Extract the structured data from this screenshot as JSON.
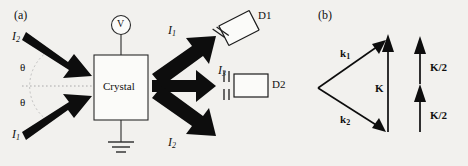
{
  "figure": {
    "background_color": "#f2f1ee",
    "ink_color": "#101010"
  },
  "panel_a": {
    "tag": "(a)",
    "device": {
      "label": "Crystal",
      "voltmeter_label": "V",
      "voltmeter_name": "voltmeter",
      "ground_name": "ground-symbol"
    },
    "input_beams": [
      {
        "name": "input-beam-I2",
        "label": "I",
        "sub": "2",
        "direction": "down-right"
      },
      {
        "name": "input-beam-I1",
        "label": "I",
        "sub": "1",
        "direction": "up-right"
      }
    ],
    "angles": [
      {
        "name": "angle-theta-upper",
        "label": "θ"
      },
      {
        "name": "angle-theta-lower",
        "label": "θ"
      }
    ],
    "output_beams": [
      {
        "name": "output-beam-I1",
        "label": "I",
        "sub": "1",
        "direction": "up-right"
      },
      {
        "name": "output-beam-I3",
        "label": "I",
        "sub": "3",
        "direction": "right"
      },
      {
        "name": "output-beam-I2",
        "label": "I",
        "sub": "2",
        "direction": "down-right"
      }
    ],
    "detectors": [
      {
        "name": "detector-d1",
        "label": "D1",
        "tilted": true
      },
      {
        "name": "detector-d2",
        "label": "D2",
        "tilted": false
      }
    ]
  },
  "panel_b": {
    "tag": "(b)",
    "vectors": [
      {
        "name": "vector-k1",
        "label": "k",
        "sub": "1"
      },
      {
        "name": "vector-k2",
        "label": "k",
        "sub": "2"
      },
      {
        "name": "vector-K",
        "label": "K",
        "sub": ""
      },
      {
        "name": "vector-K-half-upper",
        "label": "K/2",
        "sub": ""
      },
      {
        "name": "vector-K-half-lower",
        "label": "K/2",
        "sub": ""
      }
    ]
  }
}
